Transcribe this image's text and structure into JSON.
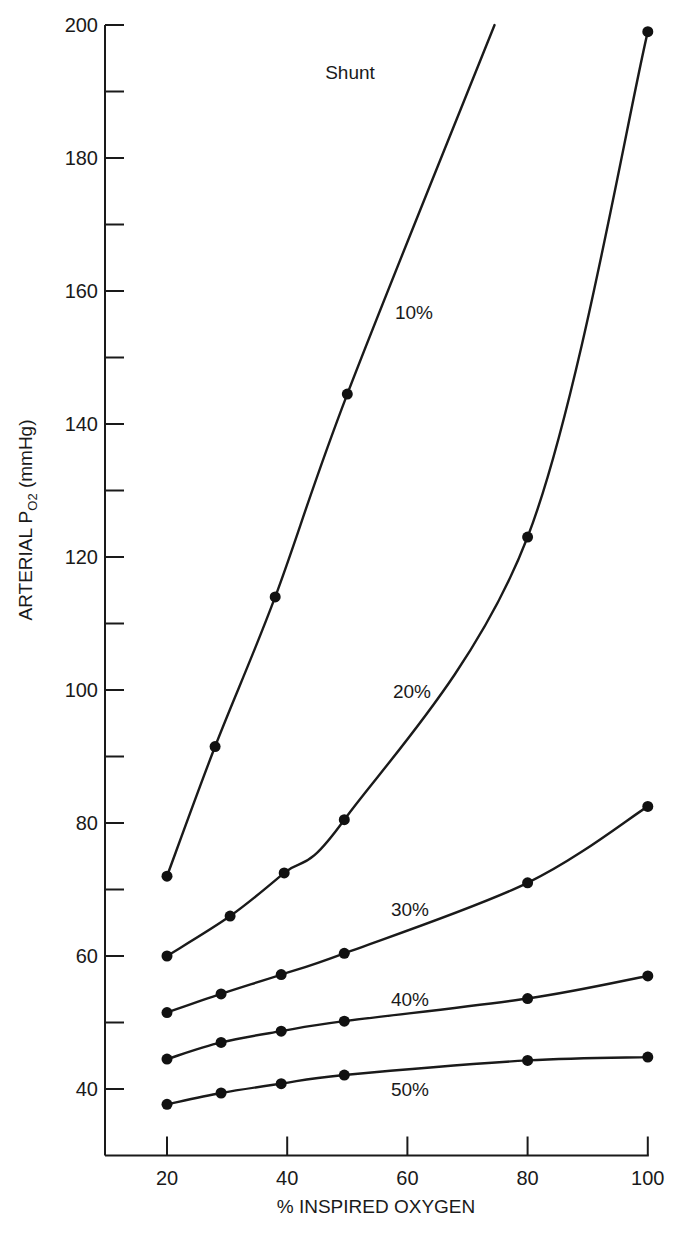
{
  "chart_data": {
    "type": "line",
    "title": "",
    "xlabel": "% INSPIRED OXYGEN",
    "ylabel_main": "ARTERIAL P",
    "ylabel_sub": "O2",
    "ylabel_unit": " (mmHg)",
    "ylabel": "ARTERIAL PO2 (mmHg)",
    "xlim": [
      9,
      100
    ],
    "ylim": [
      30,
      200
    ],
    "x_ticks": [
      20,
      40,
      60,
      80,
      100
    ],
    "y_ticks_major": [
      40,
      60,
      80,
      100,
      120,
      140,
      160,
      180,
      200
    ],
    "y_ticks_minor": [
      50,
      70,
      90,
      110,
      130,
      150,
      170,
      190
    ],
    "grid": false,
    "legend": "inline labels",
    "annotation": "Shunt",
    "series": [
      {
        "name": "10%",
        "label_pos": [
          414,
          319
        ],
        "x": [
          20,
          28,
          38,
          50
        ],
        "y": [
          72,
          91.5,
          114,
          144.5
        ],
        "curve_end": [
          74.5,
          200
        ]
      },
      {
        "name": "20%",
        "label_pos": [
          412,
          698
        ],
        "x": [
          20,
          30.5,
          39.5,
          49.5,
          80,
          100
        ],
        "y": [
          60,
          66,
          72.5,
          80.5,
          123,
          199
        ]
      },
      {
        "name": "30%",
        "label_pos": [
          410,
          916
        ],
        "x": [
          20,
          29,
          39,
          49.5,
          80,
          100
        ],
        "y": [
          51.5,
          54.3,
          57.2,
          60.4,
          71,
          82.5
        ]
      },
      {
        "name": "40%",
        "label_pos": [
          410,
          1006
        ],
        "x": [
          20,
          29,
          39,
          49.5,
          80,
          100
        ],
        "y": [
          44.5,
          47,
          48.7,
          50.2,
          53.6,
          57
        ]
      },
      {
        "name": "50%",
        "label_pos": [
          410,
          1096
        ],
        "x": [
          20,
          29,
          39,
          49.5,
          80,
          100
        ],
        "y": [
          37.7,
          39.4,
          40.8,
          42.1,
          44.3,
          44.8
        ]
      }
    ]
  }
}
